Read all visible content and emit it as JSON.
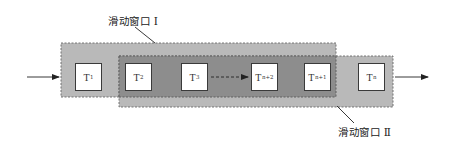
{
  "diagram": {
    "type": "sliding-window",
    "colors": {
      "background": "#ffffff",
      "window_fill": "#b9b9b9",
      "overlap_fill": "#8d8d8d",
      "window_border": "#6a6a6a",
      "box_fill": "#ffffff",
      "box_border": "#3a3a3a",
      "arrow": "#222222"
    },
    "windows": [
      {
        "id": "window-1",
        "label": "滑动窗口 Ⅰ"
      },
      {
        "id": "window-2",
        "label": "滑动窗口 Ⅱ"
      }
    ],
    "nodes": [
      {
        "id": "T1",
        "base": "T",
        "sub": "1"
      },
      {
        "id": "T2",
        "base": "T",
        "sub": "2"
      },
      {
        "id": "T3",
        "base": "T",
        "sub": "3"
      },
      {
        "id": "Tn+2",
        "base": "T",
        "sub": "n+2"
      },
      {
        "id": "Tn+1",
        "base": "T",
        "sub": "n+1"
      },
      {
        "id": "Tn",
        "base": "T",
        "sub": "n"
      }
    ],
    "edges": [
      {
        "from": "input",
        "to": "window-1",
        "style": "solid-arrow"
      },
      {
        "from": "T3",
        "to": "Tn+2",
        "style": "dashed-arrow"
      },
      {
        "from": "window-2",
        "to": "output",
        "style": "solid-arrow"
      }
    ]
  }
}
